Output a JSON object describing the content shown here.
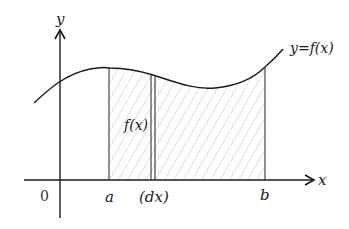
{
  "diagram": {
    "axes": {
      "x_label": "x",
      "y_label": "y",
      "origin_label": "0"
    },
    "curve": {
      "label": "y=f(x)"
    },
    "bounds": {
      "lower_label": "a",
      "upper_label": "b"
    },
    "strip": {
      "width_label": "(dx)",
      "height_label": "f(x)"
    },
    "colors": {
      "stroke": "#1a1a1a",
      "hatch": "#bdbdbd",
      "background": "#ffffff"
    }
  }
}
